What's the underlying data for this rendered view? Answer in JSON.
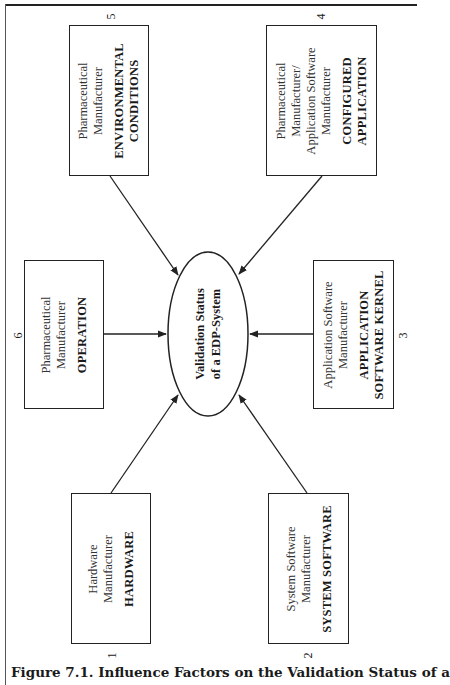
{
  "figure": {
    "caption": "Figure 7.1. Influence Factors on the Validation Status of a",
    "center": {
      "line1": "Validation Status",
      "line2": "of a EDP-System"
    },
    "factors": [
      {
        "number": "1",
        "manufacturer": [
          "Hardware",
          "Manufacturer"
        ],
        "title": [
          "HARDWARE"
        ]
      },
      {
        "number": "2",
        "manufacturer": [
          "System Software",
          "Manufacturer"
        ],
        "title": [
          "SYSTEM SOFTWARE"
        ]
      },
      {
        "number": "3",
        "manufacturer": [
          "Application Software",
          "Manufacturer"
        ],
        "title": [
          "APPLICATION",
          "SOFTWARE KERNEL"
        ]
      },
      {
        "number": "4",
        "manufacturer": [
          "Pharmaceutical",
          "Manufacturer/",
          "Application Software",
          "Manufacturer"
        ],
        "title": [
          "CONFIGURED",
          "APPLICATION"
        ]
      },
      {
        "number": "5",
        "manufacturer": [
          "Pharmaceutical",
          "Manufacturer"
        ],
        "title": [
          "ENVIRONMENTAL",
          "CONDITIONS"
        ]
      },
      {
        "number": "6",
        "manufacturer": [
          "Pharmaceutical",
          "Manufacturer"
        ],
        "title": [
          "OPERATION"
        ]
      }
    ]
  },
  "colors": {
    "line": "#222222",
    "text": "#1a1a1a",
    "background": "#ffffff"
  }
}
